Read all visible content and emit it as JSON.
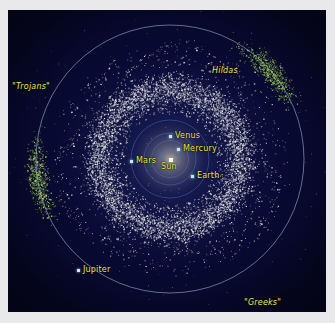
{
  "figure": {
    "background_color": "#0a0b38",
    "matte_color": "#e9e9ec",
    "label_color": "#ece94a",
    "orbit_color": "#8fa7c8",
    "asteroid_color": "#e8e8e8",
    "trojan_color": "#86d14a",
    "view": "ecliptic plane, heliocentric, top-down"
  },
  "chart_data": {
    "type": "scatter",
    "xlabel": "",
    "ylabel": "",
    "grid": false,
    "legend_position": "none",
    "axis_units": "AU",
    "xlim": [
      -6.2,
      6.2
    ],
    "ylim": [
      -6.2,
      6.2
    ],
    "center_px": [
      170,
      159
    ],
    "px_per_au": 25.8,
    "populations": [
      {
        "name": "Main Belt",
        "color": "#e8e8e8",
        "count": 7000,
        "inner_radius_au": 1.8,
        "outer_radius_au": 4.5,
        "peak_radius_au": 2.8,
        "description": "dense ring of main-belt asteroids between Mars and Jupiter"
      },
      {
        "name": "Hildas",
        "color": "#dcd8b0",
        "count": 240,
        "radius_au": 3.95,
        "description": "triangular resonant family, 3:2 resonance with Jupiter"
      },
      {
        "name": "Trojans",
        "color": "#86d14a",
        "count": 620,
        "radius_au": 5.2,
        "lagrange_point": "L4",
        "angle_deg": 172,
        "description": "leading Jupiter Trojan camp"
      },
      {
        "name": "Greeks",
        "color": "#8ede4e",
        "count": 620,
        "radius_au": 5.2,
        "lagrange_point": "L5",
        "angle_deg": 318,
        "description": "trailing Jupiter Trojan camp"
      }
    ],
    "orbits": [
      {
        "name": "Mercury",
        "radius_au": 0.39
      },
      {
        "name": "Venus",
        "radius_au": 0.72
      },
      {
        "name": "Earth",
        "radius_au": 1.0
      },
      {
        "name": "Mars",
        "radius_au": 1.52
      },
      {
        "name": "Jupiter",
        "radius_au": 5.2
      }
    ],
    "bodies": [
      {
        "name": "Sun",
        "x_px": 170,
        "y_px": 159,
        "label_dx": -9,
        "label_dy": 6,
        "marker": "sun"
      },
      {
        "name": "Mercury",
        "x_px": 178,
        "y_px": 149,
        "label_dx": 5,
        "label_dy": -4,
        "marker": "planet"
      },
      {
        "name": "Venus",
        "x_px": 170,
        "y_px": 136,
        "label_dx": 5,
        "label_dy": -4,
        "marker": "planet"
      },
      {
        "name": "Earth",
        "x_px": 192,
        "y_px": 176,
        "label_dx": 5,
        "label_dy": -4,
        "marker": "planet"
      },
      {
        "name": "Mars",
        "x_px": 131,
        "y_px": 161,
        "label_dx": 5,
        "label_dy": -4,
        "marker": "planet"
      },
      {
        "name": "Jupiter",
        "x_px": 78,
        "y_px": 270,
        "label_dx": 5,
        "label_dy": -4,
        "marker": "jupiter"
      }
    ]
  },
  "labels": {
    "sun": "Sun",
    "mercury": "Mercury",
    "venus": "Venus",
    "earth": "Earth",
    "mars": "Mars",
    "jupiter": "Jupiter",
    "trojans": "\"Trojans\"",
    "hildas": "Hildas",
    "greeks": "\"Greeks\""
  },
  "label_positions": {
    "trojans": {
      "x": 12,
      "y": 82
    },
    "hildas": {
      "x": 212,
      "y": 66
    },
    "greeks": {
      "x": 244,
      "y": 298
    }
  }
}
